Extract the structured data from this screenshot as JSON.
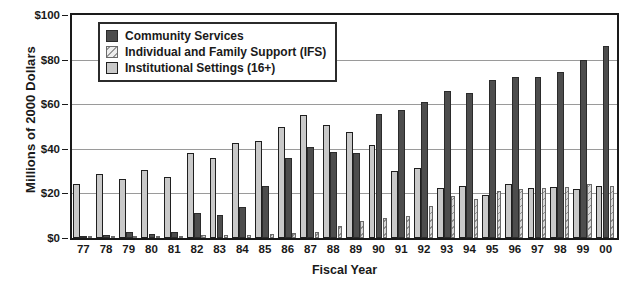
{
  "chart_data": {
    "type": "bar",
    "title": "",
    "xlabel": "Fiscal Year",
    "ylabel": "Millions of 2000 Dollars",
    "ylim": [
      0,
      100
    ],
    "yticks": [
      0,
      20,
      40,
      60,
      80,
      100
    ],
    "ytick_labels": [
      "$0",
      "$20",
      "$40",
      "$60",
      "$80",
      "$100"
    ],
    "grid": true,
    "legend_position": "upper-left-inside",
    "categories": [
      "77",
      "78",
      "79",
      "80",
      "81",
      "82",
      "83",
      "84",
      "85",
      "86",
      "87",
      "88",
      "89",
      "90",
      "91",
      "92",
      "93",
      "94",
      "95",
      "96",
      "97",
      "98",
      "99",
      "00"
    ],
    "series": [
      {
        "name": "Institutional Settings (16+)",
        "color": "#c9c9c9",
        "values": [
          24.0,
          28.5,
          26.5,
          30.5,
          27.5,
          38.0,
          36.0,
          42.5,
          43.5,
          50.0,
          55.0,
          50.5,
          47.5,
          41.5,
          30.0,
          31.5,
          22.5,
          23.5,
          19.5,
          24.0,
          22.5,
          23.0,
          22.0,
          23.5
        ]
      },
      {
        "name": "Community Services",
        "color": "#4d4d4d",
        "values": [
          1.0,
          1.5,
          2.5,
          2.0,
          2.5,
          11.0,
          10.5,
          14.0,
          23.5,
          36.0,
          41.0,
          38.5,
          38.0,
          55.5,
          57.5,
          61.0,
          66.0,
          65.0,
          71.0,
          72.0,
          72.0,
          74.5,
          80.0,
          86.0
        ]
      },
      {
        "name": "Individual and Family Support (IFS)",
        "color": "#d9d9d9",
        "values": [
          0.5,
          0.8,
          0.8,
          0.8,
          0.8,
          1.2,
          1.2,
          1.5,
          1.8,
          2.2,
          2.5,
          5.5,
          7.5,
          9.0,
          10.0,
          14.5,
          19.0,
          17.5,
          21.0,
          22.0,
          22.5,
          23.0,
          24.0,
          23.5
        ]
      }
    ]
  },
  "legend": {
    "items": [
      {
        "label": "Community Services",
        "swatch": "cs"
      },
      {
        "label": "Individual and Family Support (IFS)",
        "swatch": "ifs"
      },
      {
        "label": "Institutional Settings (16+)",
        "swatch": "inst"
      }
    ]
  }
}
